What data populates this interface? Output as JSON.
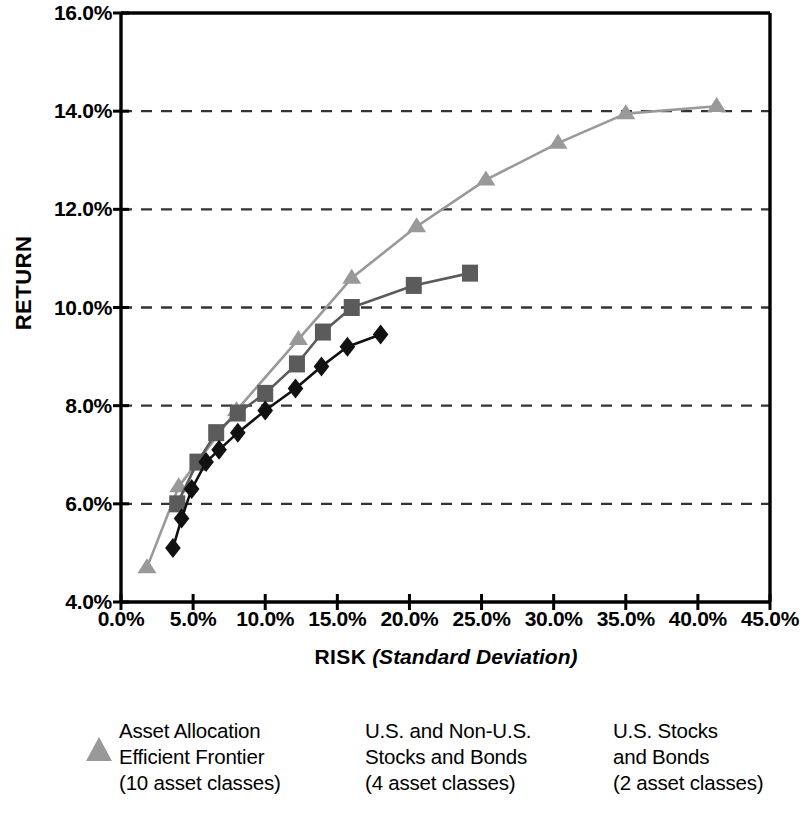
{
  "chart_data": {
    "type": "line",
    "title": "",
    "xlabel": "RISK (Standard Deviation)",
    "ylabel": "RETURN",
    "xlim": [
      0,
      45
    ],
    "ylim": [
      4,
      16
    ],
    "xticks": [
      "0.0%",
      "5.0%",
      "10.0%",
      "15.0%",
      "20.0%",
      "25.0%",
      "30.0%",
      "35.0%",
      "40.0%",
      "45.0%"
    ],
    "xtick_values": [
      0,
      5,
      10,
      15,
      20,
      25,
      30,
      35,
      40,
      45
    ],
    "yticks": [
      "4.0%",
      "6.0%",
      "8.0%",
      "10.0%",
      "12.0%",
      "14.0%",
      "16.0%"
    ],
    "ytick_values": [
      4,
      6,
      8,
      10,
      12,
      14,
      16
    ],
    "grid": "horizontal-dashed",
    "legend_position": "bottom",
    "series": [
      {
        "name": "Asset Allocation Efficient Frontier (10 asset classes)",
        "marker": "triangle",
        "color": "#999999",
        "points": [
          [
            1.8,
            4.7
          ],
          [
            4.0,
            6.35
          ],
          [
            8.0,
            7.9
          ],
          [
            12.3,
            9.35
          ],
          [
            16.0,
            10.6
          ],
          [
            20.5,
            11.65
          ],
          [
            25.3,
            12.6
          ],
          [
            30.3,
            13.35
          ],
          [
            35.0,
            13.95
          ],
          [
            41.3,
            14.1
          ]
        ]
      },
      {
        "name": "U.S. and Non-U.S. Stocks and Bonds (4 asset classes)",
        "marker": "square",
        "color": "#5b5b5b",
        "points": [
          [
            3.9,
            6.0
          ],
          [
            5.3,
            6.85
          ],
          [
            6.6,
            7.45
          ],
          [
            8.1,
            7.85
          ],
          [
            10.0,
            8.25
          ],
          [
            12.2,
            8.85
          ],
          [
            14.0,
            9.5
          ],
          [
            16.0,
            10.0
          ],
          [
            20.3,
            10.45
          ],
          [
            24.2,
            10.7
          ]
        ]
      },
      {
        "name": "U.S. Stocks and Bonds (2 asset classes)",
        "marker": "diamond",
        "color": "#111111",
        "points": [
          [
            3.6,
            5.1
          ],
          [
            4.2,
            5.7
          ],
          [
            4.9,
            6.3
          ],
          [
            5.9,
            6.85
          ],
          [
            6.8,
            7.1
          ],
          [
            8.1,
            7.45
          ],
          [
            10.0,
            7.9
          ],
          [
            12.1,
            8.35
          ],
          [
            13.9,
            8.8
          ],
          [
            15.7,
            9.2
          ],
          [
            18.0,
            9.45
          ]
        ]
      }
    ]
  },
  "axes": {
    "y_title": "RETURN",
    "x_title_bold": "RISK",
    "x_title_italic": "(Standard Deviation)"
  },
  "legend": {
    "items": [
      {
        "marker": "triangle",
        "color": "#999999",
        "label": "Asset Allocation\nEfficient Frontier\n(10 asset classes)"
      },
      {
        "marker": "square",
        "color": "#5b5b5b",
        "label": "U.S. and Non-U.S.\nStocks and Bonds\n(4 asset classes)"
      },
      {
        "marker": "diamond",
        "color": "#111111",
        "label": "U.S. Stocks\nand Bonds\n(2 asset classes)"
      }
    ]
  }
}
